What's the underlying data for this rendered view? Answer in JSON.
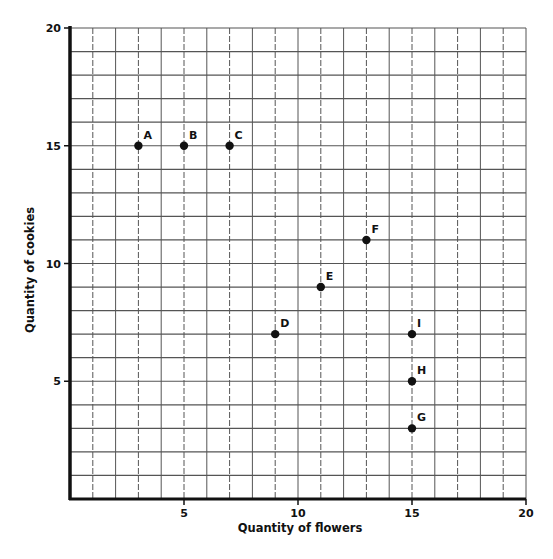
{
  "chart_data": {
    "type": "scatter",
    "title": "",
    "xlabel": "Quantity of flowers",
    "ylabel": "Quantity of cookies",
    "xlim": [
      0,
      20
    ],
    "ylim": [
      0,
      20
    ],
    "x_ticks": [
      5,
      10,
      15,
      20
    ],
    "y_ticks": [
      5,
      10,
      15,
      20
    ],
    "grid": true,
    "grid_step": 1,
    "legend": null,
    "points": [
      {
        "label": "A",
        "x": 3,
        "y": 15
      },
      {
        "label": "B",
        "x": 5,
        "y": 15
      },
      {
        "label": "C",
        "x": 7,
        "y": 15
      },
      {
        "label": "D",
        "x": 9,
        "y": 7
      },
      {
        "label": "E",
        "x": 11,
        "y": 9
      },
      {
        "label": "F",
        "x": 13,
        "y": 11
      },
      {
        "label": "G",
        "x": 15,
        "y": 3
      },
      {
        "label": "H",
        "x": 15,
        "y": 5
      },
      {
        "label": "I",
        "x": 15,
        "y": 7
      }
    ]
  },
  "colors": {
    "grid": "#555555",
    "axis": "#111111",
    "point": "#111111"
  }
}
